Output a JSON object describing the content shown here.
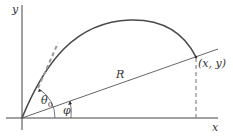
{
  "labels": {
    "y_axis": "y",
    "x_axis": "x",
    "range": "R",
    "point": "(x, y)",
    "theta": "θ",
    "theta_sub": "0",
    "phi": "φ"
  },
  "colors": {
    "axis": "#333333",
    "trajectory": "#4a4a4a",
    "dashed": "#888888"
  }
}
